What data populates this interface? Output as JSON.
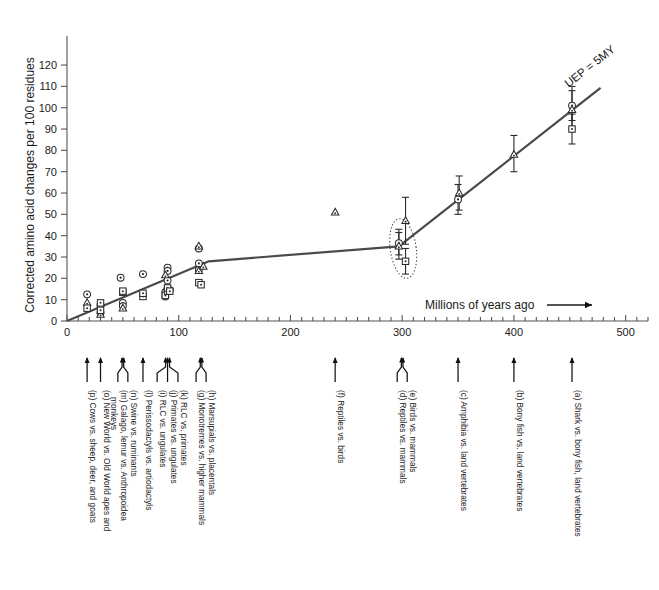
{
  "figure": {
    "ylabel": "Corrected amino acid changes per 100 residues",
    "xlabel": "Millions of years ago",
    "xlabel_arrow": "⟶",
    "annotation": "UEP = 5MY"
  },
  "chart_data": {
    "type": "scatter",
    "title": "",
    "xlabel": "Millions of years ago",
    "ylabel": "Corrected amino acid changes per 100 residues",
    "xlim": [
      0,
      520
    ],
    "ylim": [
      0,
      128
    ],
    "xticks": [
      0,
      100,
      200,
      300,
      400,
      500
    ],
    "xtick_labels": [
      "0",
      "100",
      "200",
      "300",
      "400",
      "500"
    ],
    "xminor_step": 10,
    "yticks": [
      0,
      10,
      20,
      30,
      40,
      50,
      60,
      70,
      80,
      90,
      100,
      110,
      120
    ],
    "ytick_labels": [
      "0",
      "10",
      "20",
      "30",
      "40",
      "50",
      "60",
      "70",
      "80",
      "90",
      "100",
      "110",
      "120"
    ],
    "grid": false,
    "legend": "none",
    "trend_line": {
      "name": "UEP = 5MY reference line",
      "points": [
        [
          0,
          0
        ],
        [
          127,
          28
        ],
        [
          297,
          35
        ],
        [
          455,
          100
        ]
      ]
    },
    "series": [
      {
        "name": "circle markers",
        "marker": "circle-dot",
        "points": [
          [
            18,
            12.5
          ],
          [
            30,
            7.5
          ],
          [
            30,
            4.0
          ],
          [
            48,
            20.3
          ],
          [
            50,
            8.5
          ],
          [
            50,
            7.0
          ],
          [
            68,
            22.0
          ],
          [
            88,
            13.5
          ],
          [
            88,
            11.5
          ],
          [
            90,
            25.0
          ],
          [
            90,
            23.5
          ],
          [
            90,
            19.0
          ],
          [
            90,
            15.0
          ],
          [
            92,
            14.5
          ],
          [
            118,
            34.0
          ],
          [
            118,
            27.0
          ],
          [
            118,
            24.0
          ],
          [
            297,
            36.5
          ],
          [
            350,
            57.0
          ],
          [
            452,
            101.0
          ]
        ]
      },
      {
        "name": "triangle markers",
        "marker": "triangle",
        "points": [
          [
            18,
            8.5
          ],
          [
            30,
            3.0
          ],
          [
            50,
            6.0
          ],
          [
            88,
            21.5
          ],
          [
            118,
            35.0
          ],
          [
            118,
            23.5
          ],
          [
            122,
            25.5
          ],
          [
            240,
            51.0
          ],
          [
            303,
            47.0
          ],
          [
            297,
            35.0
          ],
          [
            351,
            60.0
          ],
          [
            400,
            78.0
          ],
          [
            452,
            99.0
          ]
        ]
      },
      {
        "name": "square markers",
        "marker": "square",
        "points": [
          [
            18,
            6.0
          ],
          [
            30,
            8.5
          ],
          [
            30,
            5.0
          ],
          [
            50,
            13.5
          ],
          [
            50,
            14.0
          ],
          [
            68,
            11.5
          ],
          [
            68,
            13.0
          ],
          [
            88,
            12.0
          ],
          [
            90,
            14.0
          ],
          [
            90,
            15.5
          ],
          [
            92,
            14.0
          ],
          [
            118,
            18.0
          ],
          [
            120,
            17.0
          ],
          [
            303,
            28.0
          ],
          [
            452,
            90.0
          ]
        ]
      }
    ],
    "error_bars": [
      {
        "x": 297,
        "y": 36.5,
        "lo": 31.0,
        "hi": 43.0
      },
      {
        "x": 297,
        "y": 35.0,
        "lo": 29.0,
        "hi": 41.5
      },
      {
        "x": 303,
        "y": 47.0,
        "lo": 36.0,
        "hi": 58.0
      },
      {
        "x": 303,
        "y": 28.0,
        "lo": 22.0,
        "hi": 34.0
      },
      {
        "x": 350,
        "y": 57.0,
        "lo": 50.0,
        "hi": 64.0
      },
      {
        "x": 351,
        "y": 60.0,
        "lo": 52.0,
        "hi": 68.0
      },
      {
        "x": 400,
        "y": 78.0,
        "lo": 70.0,
        "hi": 87.0
      },
      {
        "x": 452,
        "y": 101.0,
        "lo": 94.0,
        "hi": 110.0
      },
      {
        "x": 452,
        "y": 99.0,
        "lo": 90.0,
        "hi": 108.0
      },
      {
        "x": 452,
        "y": 90.0,
        "lo": 83.0,
        "hi": 97.0
      }
    ],
    "highlight_ellipse": {
      "x": 300,
      "y_center": 34,
      "note": "dotted ellipse around reptiles/birds vs mammals cluster"
    },
    "annotations": [
      {
        "text": "UEP = 5MY",
        "x": 470,
        "y": 118,
        "rotation": -38
      }
    ]
  },
  "divergence_labels": [
    {
      "key": "p",
      "text": "(p) Cows vs. sheep, deer, and goats",
      "lines": [
        "(p) Cows vs. sheep, deer, and goats"
      ],
      "x": 18,
      "branches": 1
    },
    {
      "key": "o",
      "text": "(o) New World vs. Old World apes and monkeys",
      "lines": [
        "(o) New World vs. Old World apes and",
        "monkeys"
      ],
      "x": 30,
      "branches": 1
    },
    {
      "key": "mn",
      "text": "(m) Galago, lemur vs. Anthropoidea / (n) Swine vs. ruminants",
      "lines": [
        "(m) Galago, lemur vs. Anthropoidea",
        "(n) Swine vs. ruminants"
      ],
      "x": 50,
      "branches": 2
    },
    {
      "key": "l",
      "text": "(l) Perissodactyls vs. artiodactyls",
      "lines": [
        "(l) Perissodactyls vs. artiodactyls"
      ],
      "x": 68,
      "branches": 1
    },
    {
      "key": "ijk",
      "text": "(i) RLC vs. ungulates / (j) Primates vs. ungulates / (k) RLC vs. primates",
      "lines": [
        "(i) RLC vs. ungulates",
        "(j) Primates vs. ungulates",
        "(k) RLC vs. primates"
      ],
      "x": 90,
      "branches": 3
    },
    {
      "key": "gh",
      "text": "(g) Monotremes vs. higher mammals / (h) Marsupials vs. placentals",
      "lines": [
        "(g) Monotremes vs. higher mammals",
        "(h) Marsupials vs. placentals"
      ],
      "x": 120,
      "branches": 2
    },
    {
      "key": "f",
      "text": "(f) Reptiles vs. birds",
      "lines": [
        "(f) Reptiles vs. birds"
      ],
      "x": 240,
      "branches": 1
    },
    {
      "key": "de",
      "text": "(d) Reptiles vs. mammals / (e) Birds vs. mammals",
      "lines": [
        "(d) Reptiles vs. mammals",
        "(e) Birds vs. mammals"
      ],
      "x": 300,
      "branches": 2
    },
    {
      "key": "c",
      "text": "(c) Amphibia vs. land vertebrates",
      "lines": [
        "(c) Amphibia vs. land vertebrates"
      ],
      "x": 350,
      "branches": 1
    },
    {
      "key": "b",
      "text": "(b) Bony fish vs. land vertebrates",
      "lines": [
        "(b) Bony fish vs. land vertebrates"
      ],
      "x": 400,
      "branches": 1
    },
    {
      "key": "a",
      "text": "(a) Shark vs. bony fish, land vertebrates",
      "lines": [
        "(a) Shark vs. bony fish, land vertebrates"
      ],
      "x": 452,
      "branches": 1
    }
  ]
}
